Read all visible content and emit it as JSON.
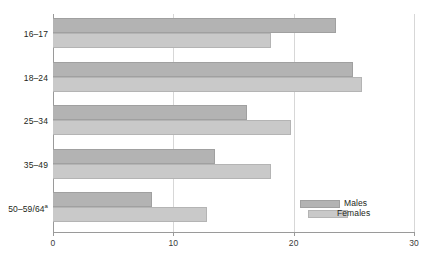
{
  "chart_data": {
    "type": "bar",
    "orientation": "horizontal",
    "title": "",
    "xlabel": "",
    "ylabel": "",
    "xlim": [
      0,
      30
    ],
    "xticks": [
      0,
      10,
      20,
      30
    ],
    "xtick_labels": [
      "0",
      "10",
      "20",
      "30"
    ],
    "grid": true,
    "grid_axis": "x",
    "legend_position": "bottom-right",
    "categories": [
      "16–17",
      "18–24",
      "25–34",
      "35–49",
      "50–59/64"
    ],
    "category_footnote_marker": "a",
    "series": [
      {
        "name": "Males",
        "color": "#b3b3b3",
        "values": [
          23.5,
          24.9,
          16.1,
          13.5,
          8.2
        ]
      },
      {
        "name": "Females",
        "color": "#c9c9c9",
        "values": [
          18.1,
          25.7,
          19.8,
          18.1,
          12.8
        ]
      }
    ]
  },
  "legend": {
    "items": [
      {
        "label": "Males"
      },
      {
        "label": "Females"
      }
    ]
  },
  "colors": {
    "males": "#b3b3b3",
    "females": "#c9c9c9",
    "gridline": "#d7d7d7",
    "axis": "#9a9a9a",
    "background": "#ffffff",
    "text": "#231f20"
  }
}
